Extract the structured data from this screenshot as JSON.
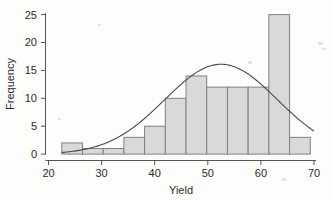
{
  "chart_data": {
    "type": "bar",
    "subtype": "histogram-with-normal-curve",
    "title": "",
    "subtitle": "",
    "xlabel": "Yield",
    "ylabel": "Frequency",
    "xlim": [
      20,
      70
    ],
    "ylim": [
      0,
      26
    ],
    "xticks": [
      20,
      30,
      40,
      50,
      60,
      70
    ],
    "xtick_labels": [
      "20",
      "30",
      "40",
      "50",
      "60",
      "70"
    ],
    "yticks": [
      0,
      5,
      10,
      15,
      20,
      25
    ],
    "ytick_labels": [
      "0",
      "5",
      "10",
      "15",
      "20",
      "25"
    ],
    "grid": false,
    "legend": null,
    "bin_edges": [
      22.5,
      26.4,
      30.3,
      34.2,
      38.1,
      42.0,
      45.9,
      49.8,
      53.7,
      57.6,
      61.5,
      65.4,
      69.3
    ],
    "categories": [
      "22.5-26.4",
      "26.4-30.3",
      "30.3-34.2",
      "34.2-38.1",
      "38.1-42.0",
      "42.0-45.9",
      "45.9-49.8",
      "49.8-53.7",
      "53.7-57.6",
      "57.6-61.5",
      "61.5-65.4",
      "65.4-69.3"
    ],
    "values": [
      2,
      1,
      1,
      3,
      5,
      10,
      14,
      12,
      12,
      12,
      25,
      3
    ],
    "bar_color": "#d9d9d9",
    "bar_edge_color": "#808080",
    "overlay": {
      "type": "line",
      "name": "normal curve",
      "color": "#4a4a4a",
      "mean": 52.5,
      "peak_value": 16.1,
      "sigma": 10.6,
      "x": [
        22.5,
        25,
        27.5,
        30,
        32.5,
        35,
        37.5,
        40,
        42.5,
        45,
        47.5,
        50,
        52.5,
        55,
        57.5,
        60,
        62.5,
        65,
        67.5,
        70
      ],
      "y": [
        0.2,
        0.4,
        0.8,
        1.4,
        2.3,
        3.6,
        5.3,
        7.3,
        9.6,
        11.9,
        14.0,
        15.5,
        16.1,
        15.7,
        14.3,
        12.3,
        9.9,
        7.5,
        5.4,
        3.7
      ]
    }
  }
}
